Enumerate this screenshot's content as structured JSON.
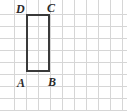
{
  "figure": {
    "canvas": {
      "width": 127,
      "height": 111,
      "background": "#ffffff"
    },
    "grid": {
      "cell_size": 12,
      "line_color": "#d6d6d6",
      "columns": 11,
      "rows": 10,
      "visible": true
    },
    "shape": {
      "name": "rectangle",
      "stroke_color": "#3a3a3a",
      "stroke_width": 2,
      "fill": "none",
      "left": 26,
      "top": 14,
      "width": 24,
      "height": 58,
      "width_cells": 2,
      "height_cells": 5
    },
    "labels": [
      {
        "text": "D",
        "name": "vertex-label-d",
        "left": 16,
        "top": 3
      },
      {
        "text": "C",
        "name": "vertex-label-c",
        "left": 47,
        "top": 2
      },
      {
        "text": "A",
        "name": "vertex-label-a",
        "left": 17,
        "top": 77
      },
      {
        "text": "B",
        "name": "vertex-label-b",
        "left": 48,
        "top": 76
      }
    ]
  }
}
